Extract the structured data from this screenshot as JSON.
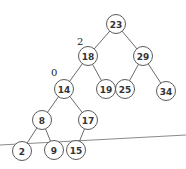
{
  "diagram": {
    "type": "binary-search-tree",
    "nodes": [
      {
        "id": "n23",
        "label": "23",
        "x": 116,
        "y": 24
      },
      {
        "id": "n18",
        "label": "18",
        "x": 88,
        "y": 56
      },
      {
        "id": "n29",
        "label": "29",
        "x": 143,
        "y": 56
      },
      {
        "id": "n14",
        "label": "14",
        "x": 64,
        "y": 89
      },
      {
        "id": "n19",
        "label": "19",
        "x": 106,
        "y": 89
      },
      {
        "id": "n25",
        "label": "25",
        "x": 125,
        "y": 89
      },
      {
        "id": "n34",
        "label": "34",
        "x": 166,
        "y": 91
      },
      {
        "id": "n8",
        "label": "8",
        "x": 42,
        "y": 120
      },
      {
        "id": "n17",
        "label": "17",
        "x": 88,
        "y": 120
      },
      {
        "id": "n2",
        "label": "2",
        "x": 22,
        "y": 151
      },
      {
        "id": "n9",
        "label": "9",
        "x": 54,
        "y": 150
      },
      {
        "id": "n15",
        "label": "15",
        "x": 76,
        "y": 150
      }
    ],
    "edges": [
      [
        "n23",
        "n18"
      ],
      [
        "n23",
        "n29"
      ],
      [
        "n18",
        "n14"
      ],
      [
        "n18",
        "n19"
      ],
      [
        "n29",
        "n25"
      ],
      [
        "n29",
        "n34"
      ],
      [
        "n14",
        "n8"
      ],
      [
        "n14",
        "n17"
      ],
      [
        "n8",
        "n2"
      ],
      [
        "n8",
        "n9"
      ],
      [
        "n17",
        "n15"
      ]
    ],
    "annotations": [
      {
        "text": "2",
        "x": 77,
        "y": 45
      },
      {
        "text": "0",
        "x": 51,
        "y": 76
      }
    ],
    "baseline": {
      "x1": 0,
      "y1": 145,
      "x2": 186,
      "y2": 135
    }
  }
}
